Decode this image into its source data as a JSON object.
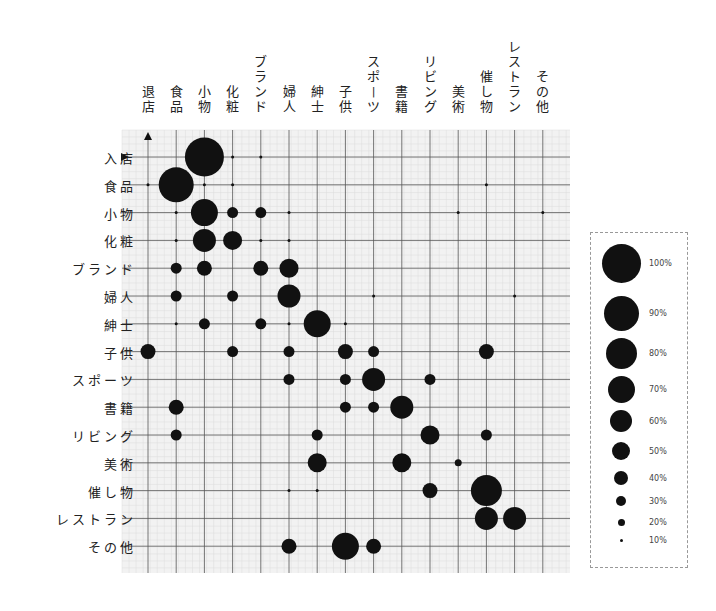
{
  "chart_data": {
    "type": "bubble-matrix",
    "title": "",
    "xlabel": "",
    "ylabel": "",
    "columns": [
      "退店",
      "食品",
      "小物",
      "化粧",
      "ブランド",
      "婦人",
      "紳士",
      "子供",
      "スポーツ",
      "書籍",
      "リビング",
      "美術",
      "催し物",
      "レストラン",
      "その他"
    ],
    "rows": [
      "入店",
      "食品",
      "小物",
      "化粧",
      "ブランド",
      "婦人",
      "紳士",
      "子供",
      "スポーツ",
      "書籍",
      "リビング",
      "美術",
      "催し物",
      "レストラン",
      "その他"
    ],
    "value_unit": "%",
    "cells": [
      {
        "row": "入店",
        "col": "小物",
        "value": 100
      },
      {
        "row": "入店",
        "col": "化粧",
        "value": 10
      },
      {
        "row": "入店",
        "col": "ブランド",
        "value": 10
      },
      {
        "row": "食品",
        "col": "退店",
        "value": 10
      },
      {
        "row": "食品",
        "col": "食品",
        "value": 90
      },
      {
        "row": "食品",
        "col": "小物",
        "value": 10
      },
      {
        "row": "食品",
        "col": "化粧",
        "value": 10
      },
      {
        "row": "食品",
        "col": "催し物",
        "value": 10
      },
      {
        "row": "小物",
        "col": "食品",
        "value": 10
      },
      {
        "row": "小物",
        "col": "小物",
        "value": 70
      },
      {
        "row": "小物",
        "col": "化粧",
        "value": 30
      },
      {
        "row": "小物",
        "col": "ブランド",
        "value": 30
      },
      {
        "row": "小物",
        "col": "婦人",
        "value": 10
      },
      {
        "row": "小物",
        "col": "美術",
        "value": 10
      },
      {
        "row": "小物",
        "col": "その他",
        "value": 10
      },
      {
        "row": "化粧",
        "col": "食品",
        "value": 10
      },
      {
        "row": "化粧",
        "col": "小物",
        "value": 60
      },
      {
        "row": "化粧",
        "col": "化粧",
        "value": 50
      },
      {
        "row": "化粧",
        "col": "ブランド",
        "value": 10
      },
      {
        "row": "化粧",
        "col": "婦人",
        "value": 10
      },
      {
        "row": "ブランド",
        "col": "食品",
        "value": 30
      },
      {
        "row": "ブランド",
        "col": "小物",
        "value": 40
      },
      {
        "row": "ブランド",
        "col": "ブランド",
        "value": 40
      },
      {
        "row": "ブランド",
        "col": "婦人",
        "value": 50
      },
      {
        "row": "婦人",
        "col": "食品",
        "value": 30
      },
      {
        "row": "婦人",
        "col": "化粧",
        "value": 30
      },
      {
        "row": "婦人",
        "col": "婦人",
        "value": 60
      },
      {
        "row": "婦人",
        "col": "スポーツ",
        "value": 10
      },
      {
        "row": "婦人",
        "col": "レストラン",
        "value": 10
      },
      {
        "row": "紳士",
        "col": "食品",
        "value": 10
      },
      {
        "row": "紳士",
        "col": "小物",
        "value": 30
      },
      {
        "row": "紳士",
        "col": "ブランド",
        "value": 30
      },
      {
        "row": "紳士",
        "col": "婦人",
        "value": 10
      },
      {
        "row": "紳士",
        "col": "紳士",
        "value": 70
      },
      {
        "row": "紳士",
        "col": "子供",
        "value": 10
      },
      {
        "row": "子供",
        "col": "退店",
        "value": 40
      },
      {
        "row": "子供",
        "col": "化粧",
        "value": 30
      },
      {
        "row": "子供",
        "col": "婦人",
        "value": 30
      },
      {
        "row": "子供",
        "col": "子供",
        "value": 40
      },
      {
        "row": "子供",
        "col": "スポーツ",
        "value": 30
      },
      {
        "row": "子供",
        "col": "催し物",
        "value": 40
      },
      {
        "row": "スポーツ",
        "col": "婦人",
        "value": 30
      },
      {
        "row": "スポーツ",
        "col": "子供",
        "value": 30
      },
      {
        "row": "スポーツ",
        "col": "スポーツ",
        "value": 60
      },
      {
        "row": "スポーツ",
        "col": "リビング",
        "value": 30
      },
      {
        "row": "書籍",
        "col": "食品",
        "value": 40
      },
      {
        "row": "書籍",
        "col": "子供",
        "value": 30
      },
      {
        "row": "書籍",
        "col": "スポーツ",
        "value": 30
      },
      {
        "row": "書籍",
        "col": "書籍",
        "value": 60
      },
      {
        "row": "リビング",
        "col": "食品",
        "value": 30
      },
      {
        "row": "リビング",
        "col": "紳士",
        "value": 30
      },
      {
        "row": "リビング",
        "col": "リビング",
        "value": 50
      },
      {
        "row": "リビング",
        "col": "催し物",
        "value": 30
      },
      {
        "row": "美術",
        "col": "紳士",
        "value": 50
      },
      {
        "row": "美術",
        "col": "書籍",
        "value": 50
      },
      {
        "row": "美術",
        "col": "美術",
        "value": 20
      },
      {
        "row": "催し物",
        "col": "婦人",
        "value": 10
      },
      {
        "row": "催し物",
        "col": "紳士",
        "value": 10
      },
      {
        "row": "催し物",
        "col": "リビング",
        "value": 40
      },
      {
        "row": "催し物",
        "col": "催し物",
        "value": 80
      },
      {
        "row": "レストラン",
        "col": "催し物",
        "value": 60
      },
      {
        "row": "レストラン",
        "col": "レストラン",
        "value": 60
      },
      {
        "row": "その他",
        "col": "婦人",
        "value": 40
      },
      {
        "row": "その他",
        "col": "子供",
        "value": 70
      },
      {
        "row": "その他",
        "col": "スポーツ",
        "value": 40
      }
    ],
    "legend": {
      "position": "right",
      "entries": [
        {
          "label": "100%",
          "value": 100
        },
        {
          "label": "90%",
          "value": 90
        },
        {
          "label": "80%",
          "value": 80
        },
        {
          "label": "70%",
          "value": 70
        },
        {
          "label": "60%",
          "value": 60
        },
        {
          "label": "50%",
          "value": 50
        },
        {
          "label": "40%",
          "value": 40
        },
        {
          "label": "30%",
          "value": 30
        },
        {
          "label": "20%",
          "value": 20
        },
        {
          "label": "10%",
          "value": 10
        }
      ]
    },
    "grid": true,
    "colors": {
      "dot": "#111111",
      "grid_major": "#555555",
      "grid_minor": "#dcdcdc",
      "background": "#f2f2f2"
    }
  }
}
